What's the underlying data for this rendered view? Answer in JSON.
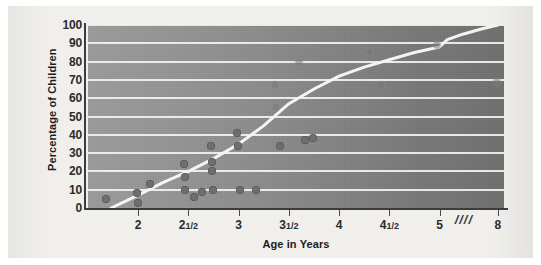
{
  "chart_data": {
    "type": "scatter",
    "title": "",
    "xlabel": "Age in Years",
    "ylabel": "Percentage of Children",
    "grid": true,
    "legend": null,
    "xlim": [
      1.5,
      8.4
    ],
    "ylim": [
      0,
      100
    ],
    "xticks": [
      {
        "value": 2,
        "label": "2"
      },
      {
        "value": 2.5,
        "label": "2",
        "fraction": "1/2"
      },
      {
        "value": 3,
        "label": "3"
      },
      {
        "value": 3.5,
        "label": "3",
        "fraction": "1/2"
      },
      {
        "value": 4,
        "label": "4"
      },
      {
        "value": 4.5,
        "label": "4",
        "fraction": "1/2"
      },
      {
        "value": 5,
        "label": "5"
      },
      {
        "value": 8,
        "label": "8"
      }
    ],
    "yticks": [
      0,
      10,
      20,
      30,
      40,
      50,
      60,
      70,
      80,
      90,
      100
    ],
    "axis_break": {
      "symbol": "////",
      "between": [
        5,
        8
      ]
    },
    "points": [
      {
        "x": 1.68,
        "y": 5,
        "style": "solid"
      },
      {
        "x": 1.99,
        "y": 8,
        "style": "solid"
      },
      {
        "x": 2.0,
        "y": 3,
        "style": "solid"
      },
      {
        "x": 2.12,
        "y": 13,
        "style": "solid"
      },
      {
        "x": 2.46,
        "y": 24,
        "style": "solid"
      },
      {
        "x": 2.47,
        "y": 17,
        "style": "solid"
      },
      {
        "x": 2.47,
        "y": 10,
        "style": "solid"
      },
      {
        "x": 2.56,
        "y": 6,
        "style": "solid"
      },
      {
        "x": 2.64,
        "y": 9,
        "style": "solid"
      },
      {
        "x": 2.72,
        "y": 34,
        "style": "solid"
      },
      {
        "x": 2.73,
        "y": 25,
        "style": "solid"
      },
      {
        "x": 2.73,
        "y": 20,
        "style": "solid"
      },
      {
        "x": 2.74,
        "y": 10,
        "style": "solid"
      },
      {
        "x": 2.98,
        "y": 41,
        "style": "solid"
      },
      {
        "x": 2.99,
        "y": 34,
        "style": "solid"
      },
      {
        "x": 3.01,
        "y": 10,
        "style": "solid"
      },
      {
        "x": 3.17,
        "y": 10,
        "style": "solid"
      },
      {
        "x": 3.36,
        "y": 67,
        "style": "faint"
      },
      {
        "x": 3.37,
        "y": 55,
        "style": "faint"
      },
      {
        "x": 3.41,
        "y": 34,
        "style": "solid"
      },
      {
        "x": 3.6,
        "y": 80,
        "style": "faint"
      },
      {
        "x": 3.66,
        "y": 37,
        "style": "solid"
      },
      {
        "x": 3.74,
        "y": 38,
        "style": "solid"
      },
      {
        "x": 4.3,
        "y": 85,
        "style": "faint"
      },
      {
        "x": 4.42,
        "y": 67,
        "style": "faint"
      },
      {
        "x": 4.97,
        "y": 89,
        "style": "faint"
      },
      {
        "x": 7.94,
        "y": 69,
        "style": "faint"
      }
    ],
    "curve": [
      {
        "x": 1.73,
        "y": 0
      },
      {
        "x": 2.0,
        "y": 7
      },
      {
        "x": 2.25,
        "y": 14
      },
      {
        "x": 2.5,
        "y": 20
      },
      {
        "x": 2.75,
        "y": 27
      },
      {
        "x": 3.0,
        "y": 35
      },
      {
        "x": 3.25,
        "y": 45
      },
      {
        "x": 3.5,
        "y": 57
      },
      {
        "x": 3.75,
        "y": 65
      },
      {
        "x": 4.0,
        "y": 72
      },
      {
        "x": 4.25,
        "y": 77
      },
      {
        "x": 4.5,
        "y": 81
      },
      {
        "x": 4.75,
        "y": 85
      },
      {
        "x": 5.0,
        "y": 88
      },
      {
        "x": 5.4,
        "y": 92
      },
      {
        "x": 6.2,
        "y": 95
      },
      {
        "x": 7.2,
        "y": 98
      },
      {
        "x": 8.0,
        "y": 100
      }
    ],
    "colors": {
      "plot_background_left": "#9b9b9b",
      "plot_background_right": "#707070",
      "gridline": "#f2f2ef",
      "curve": "#f4f4f1",
      "dot": "#6e6e6e",
      "axis": "#3c3c3c",
      "page_background": "#f0efec",
      "text": "#1c1c1c"
    }
  }
}
